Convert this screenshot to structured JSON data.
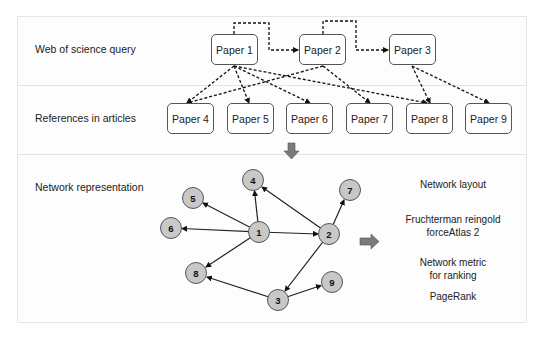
{
  "rows": {
    "query_label": "Web of science query",
    "references_label": "References in articles",
    "network_label": "Network representation"
  },
  "query_papers": [
    {
      "id": "p1",
      "label": "Paper 1"
    },
    {
      "id": "p2",
      "label": "Paper 2"
    },
    {
      "id": "p3",
      "label": "Paper 3"
    }
  ],
  "reference_papers": [
    {
      "id": "p4",
      "label": "Paper 4"
    },
    {
      "id": "p5",
      "label": "Paper 5"
    },
    {
      "id": "p6",
      "label": "Paper 6"
    },
    {
      "id": "p7",
      "label": "Paper 7"
    },
    {
      "id": "p8",
      "label": "Paper 8"
    },
    {
      "id": "p9",
      "label": "Paper 9"
    }
  ],
  "citation_edges": [
    [
      "Paper 1",
      "Paper 4"
    ],
    [
      "Paper 1",
      "Paper 5"
    ],
    [
      "Paper 1",
      "Paper 6"
    ],
    [
      "Paper 1",
      "Paper 8"
    ],
    [
      "Paper 2",
      "Paper 4"
    ],
    [
      "Paper 2",
      "Paper 7"
    ],
    [
      "Paper 3",
      "Paper 8"
    ],
    [
      "Paper 3",
      "Paper 9"
    ]
  ],
  "query_sequence_edges": [
    [
      "Paper 1",
      "Paper 2"
    ],
    [
      "Paper 2",
      "Paper 3"
    ]
  ],
  "network": {
    "nodes": [
      {
        "label": "1",
        "x": 259,
        "y": 232
      },
      {
        "label": "2",
        "x": 329,
        "y": 234
      },
      {
        "label": "3",
        "x": 278,
        "y": 300
      },
      {
        "label": "4",
        "x": 253,
        "y": 180
      },
      {
        "label": "5",
        "x": 193,
        "y": 198
      },
      {
        "label": "6",
        "x": 171,
        "y": 228
      },
      {
        "label": "7",
        "x": 350,
        "y": 190
      },
      {
        "label": "8",
        "x": 196,
        "y": 273
      },
      {
        "label": "9",
        "x": 332,
        "y": 282
      }
    ],
    "edges": [
      [
        "1",
        "4"
      ],
      [
        "1",
        "5"
      ],
      [
        "1",
        "6"
      ],
      [
        "1",
        "8"
      ],
      [
        "1",
        "2"
      ],
      [
        "2",
        "4"
      ],
      [
        "2",
        "7"
      ],
      [
        "2",
        "3"
      ],
      [
        "3",
        "8"
      ],
      [
        "3",
        "9"
      ]
    ],
    "node_fill": "#c8c8c8",
    "node_stroke": "#555555"
  },
  "right_panel": {
    "layout_title": "Network layout",
    "layout_line1": "Fruchterman reingold",
    "layout_line2": "forceAtlas 2",
    "metric_line1": "Network metric",
    "metric_line2": "for ranking",
    "metric_value": "PageRank"
  },
  "arrow_color": "#7a7a7a"
}
